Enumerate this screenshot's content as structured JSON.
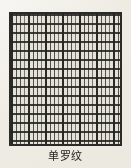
{
  "figure": {
    "caption": "单罗纹",
    "frame_color": "#2a2a28",
    "cell_color": "#e7e4db",
    "line_color": "#1c1c1a",
    "page_color": "#efece4"
  },
  "chart_data": {
    "type": "diagram",
    "title": "单罗纹",
    "vertical_groups": 7,
    "vertical_group_period_px": 17,
    "lines_per_vertical_group": 4,
    "horizontal_lines": 15,
    "horizontal_line_period_px": 9,
    "xlabel": "",
    "ylabel": "",
    "grid": true,
    "legend": "none"
  }
}
